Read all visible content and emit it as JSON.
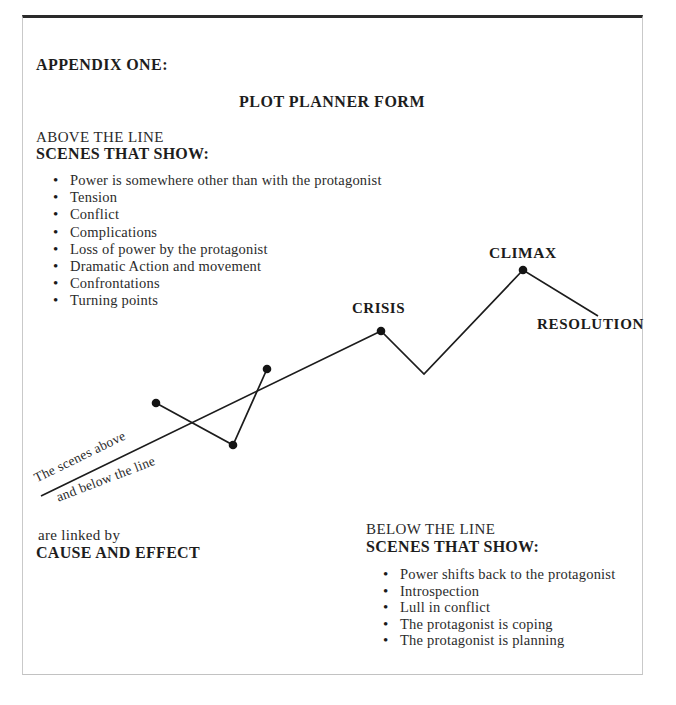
{
  "header": {
    "appendix_label": "APPENDIX ONE:",
    "form_title": "PLOT PLANNER FORM"
  },
  "above_section": {
    "heading_line1": "ABOVE THE LINE",
    "heading_line2": "SCENES THAT SHOW:",
    "items": [
      "Power is somewhere other than with the protagonist",
      "Tension",
      "Conflict",
      "Complications",
      "Loss of power by the protagonist",
      "Dramatic Action and movement",
      "Confrontations",
      "Turning points"
    ]
  },
  "below_section": {
    "heading_line1": "BELOW THE LINE",
    "heading_line2": "SCENES THAT SHOW:",
    "items": [
      "Power shifts back to the protagonist",
      "Introspection",
      "Lull in conflict",
      "The protagonist is coping",
      "The protagonist is planning"
    ]
  },
  "link_note": {
    "line1": "are linked by",
    "line2": "CAUSE AND EFFECT"
  },
  "diagram": {
    "crisis_label": "CRISIS",
    "climax_label": "CLIMAX",
    "resolution_label": "RESOLUTION",
    "note_line1": "The scenes above",
    "note_line2": "and below the line",
    "line_color": "#1c1c1c",
    "dot_color": "#141414",
    "plot_line_points": "41,496 381,331 424,374 523,270 598,316",
    "zigzag_points": "156,403 233,445 267,369",
    "dots": [
      [
        156,
        403
      ],
      [
        233,
        445
      ],
      [
        267,
        369
      ],
      [
        381,
        331
      ],
      [
        523,
        270
      ]
    ]
  }
}
